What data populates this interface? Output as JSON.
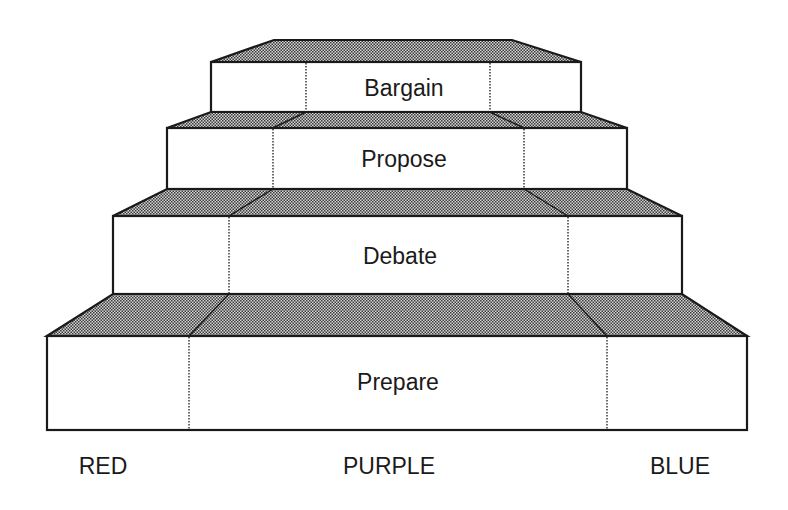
{
  "diagram": {
    "type": "stepped-pyramid",
    "tiers": [
      {
        "label": "Bargain",
        "roof": {
          "top_y": 40,
          "top_x1": 274,
          "top_x2": 512,
          "div_top_left": 313,
          "div_top_right": 470
        },
        "box": {
          "x1": 211,
          "x2": 581,
          "y1": 62,
          "y2": 112
        },
        "dividers": [
          306,
          490
        ],
        "label_x": 404,
        "label_y": 96
      },
      {
        "label": "Propose",
        "roof": {
          "top_y": 112,
          "top_x1": 211,
          "top_x2": 581,
          "div_top_left": 306,
          "div_top_right": 490
        },
        "box": {
          "x1": 167,
          "x2": 627,
          "y1": 128,
          "y2": 189
        },
        "dividers": [
          273,
          524
        ],
        "label_x": 404,
        "label_y": 167
      },
      {
        "label": "Debate",
        "roof": {
          "top_y": 189,
          "top_x1": 167,
          "top_x2": 627,
          "div_top_left": 273,
          "div_top_right": 524
        },
        "box": {
          "x1": 113,
          "x2": 682,
          "y1": 216,
          "y2": 294
        },
        "dividers": [
          229,
          568
        ],
        "label_x": 400,
        "label_y": 264
      },
      {
        "label": "Prepare",
        "roof": {
          "top_y": 294,
          "top_x1": 113,
          "top_x2": 682,
          "div_top_left": 229,
          "div_top_right": 568
        },
        "box": {
          "x1": 47,
          "x2": 747,
          "y1": 336,
          "y2": 430
        },
        "dividers": [
          189,
          607
        ],
        "label_x": 398,
        "label_y": 390
      }
    ],
    "columns": [
      {
        "label": "RED",
        "x": 103,
        "y": 474
      },
      {
        "label": "PURPLE",
        "x": 389,
        "y": 474
      },
      {
        "label": "BLUE",
        "x": 680,
        "y": 474
      }
    ],
    "colors": {
      "stroke": "#1a1a1a",
      "roof_dot": "#3a3a3a",
      "roof_bg": "#cfcfcf",
      "box_fill": "#ffffff"
    }
  }
}
